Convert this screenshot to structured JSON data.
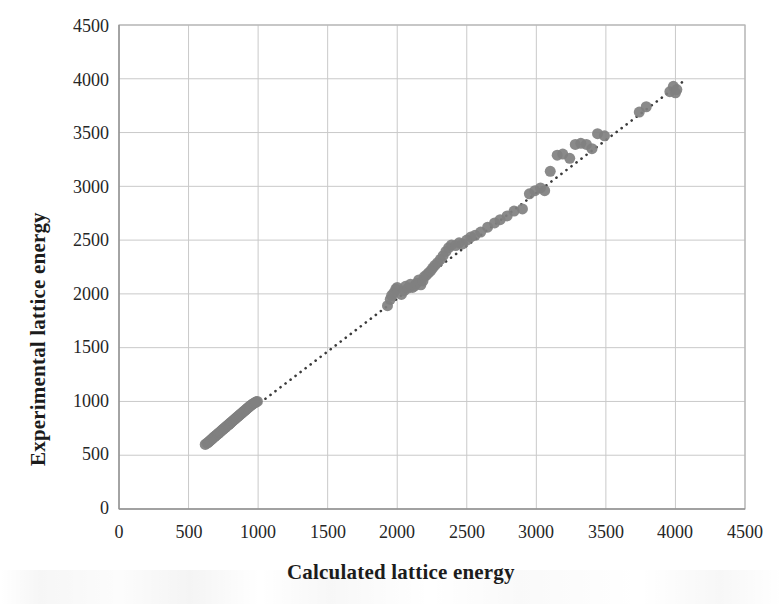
{
  "chart_data": {
    "type": "scatter",
    "title": "",
    "xlabel": "Calculated lattice energy",
    "ylabel": "Experimental lattice energy",
    "xlim": [
      0,
      4500
    ],
    "ylim": [
      0,
      4500
    ],
    "xticks": [
      0,
      500,
      1000,
      1500,
      2000,
      2500,
      3000,
      3500,
      4000,
      4500
    ],
    "yticks": [
      0,
      500,
      1000,
      1500,
      2000,
      2500,
      3000,
      3500,
      4000,
      4500
    ],
    "xtick_labels": [
      "0",
      "500",
      "1000",
      "1500",
      "2000",
      "2500",
      "3000",
      "3500",
      "4000",
      "4500"
    ],
    "ytick_labels": [
      "0",
      "500",
      "1000",
      "1500",
      "2000",
      "2500",
      "3000",
      "3500",
      "4000",
      "4500"
    ],
    "grid": true,
    "legend": false,
    "marker_color": "#808080",
    "marker_size": 11,
    "grid_color": "#c9c9c9",
    "trendline": {
      "style": "dotted",
      "color": "#3b3b3b",
      "x_start": 620,
      "y_start": 600,
      "x_end": 4060,
      "y_end": 3980
    },
    "series": [
      {
        "name": "lattice energy",
        "points": [
          [
            620,
            600
          ],
          [
            632,
            612
          ],
          [
            640,
            618
          ],
          [
            648,
            628
          ],
          [
            655,
            636
          ],
          [
            663,
            645
          ],
          [
            670,
            652
          ],
          [
            676,
            662
          ],
          [
            683,
            668
          ],
          [
            690,
            676
          ],
          [
            697,
            684
          ],
          [
            703,
            690
          ],
          [
            710,
            698
          ],
          [
            716,
            704
          ],
          [
            722,
            712
          ],
          [
            728,
            718
          ],
          [
            735,
            726
          ],
          [
            741,
            733
          ],
          [
            747,
            740
          ],
          [
            753,
            746
          ],
          [
            760,
            754
          ],
          [
            766,
            760
          ],
          [
            772,
            768
          ],
          [
            778,
            774
          ],
          [
            785,
            782
          ],
          [
            791,
            788
          ],
          [
            797,
            795
          ],
          [
            803,
            802
          ],
          [
            810,
            810
          ],
          [
            816,
            816
          ],
          [
            822,
            823
          ],
          [
            828,
            830
          ],
          [
            835,
            838
          ],
          [
            841,
            844
          ],
          [
            847,
            851
          ],
          [
            853,
            858
          ],
          [
            860,
            866
          ],
          [
            866,
            872
          ],
          [
            872,
            879
          ],
          [
            878,
            886
          ],
          [
            885,
            894
          ],
          [
            891,
            900
          ],
          [
            897,
            907
          ],
          [
            903,
            914
          ],
          [
            910,
            922
          ],
          [
            916,
            928
          ],
          [
            922,
            935
          ],
          [
            928,
            942
          ],
          [
            935,
            950
          ],
          [
            941,
            956
          ],
          [
            948,
            963
          ],
          [
            955,
            970
          ],
          [
            962,
            977
          ],
          [
            970,
            984
          ],
          [
            978,
            990
          ],
          [
            986,
            996
          ],
          [
            995,
            1000
          ],
          [
            1930,
            1890
          ],
          [
            1950,
            1950
          ],
          [
            1960,
            1985
          ],
          [
            1975,
            2010
          ],
          [
            1990,
            2045
          ],
          [
            2000,
            2060
          ],
          [
            2030,
            1995
          ],
          [
            2050,
            2030
          ],
          [
            2060,
            2070
          ],
          [
            2080,
            2055
          ],
          [
            2095,
            2090
          ],
          [
            2110,
            2060
          ],
          [
            2125,
            2075
          ],
          [
            2140,
            2100
          ],
          [
            2155,
            2130
          ],
          [
            2170,
            2085
          ],
          [
            2185,
            2120
          ],
          [
            2195,
            2160
          ],
          [
            2210,
            2175
          ],
          [
            2225,
            2195
          ],
          [
            2240,
            2215
          ],
          [
            2255,
            2240
          ],
          [
            2270,
            2265
          ],
          [
            2290,
            2290
          ],
          [
            2310,
            2320
          ],
          [
            2330,
            2355
          ],
          [
            2350,
            2395
          ],
          [
            2370,
            2430
          ],
          [
            2390,
            2455
          ],
          [
            2420,
            2450
          ],
          [
            2445,
            2475
          ],
          [
            2470,
            2465
          ],
          [
            2500,
            2500
          ],
          [
            2530,
            2530
          ],
          [
            2560,
            2545
          ],
          [
            2600,
            2575
          ],
          [
            2650,
            2620
          ],
          [
            2700,
            2660
          ],
          [
            2740,
            2690
          ],
          [
            2790,
            2725
          ],
          [
            2840,
            2770
          ],
          [
            2900,
            2790
          ],
          [
            2950,
            2930
          ],
          [
            2990,
            2960
          ],
          [
            3030,
            2985
          ],
          [
            3060,
            2960
          ],
          [
            3100,
            3140
          ],
          [
            3150,
            3290
          ],
          [
            3190,
            3300
          ],
          [
            3240,
            3260
          ],
          [
            3280,
            3390
          ],
          [
            3320,
            3400
          ],
          [
            3360,
            3390
          ],
          [
            3400,
            3350
          ],
          [
            3440,
            3490
          ],
          [
            3490,
            3470
          ],
          [
            3740,
            3690
          ],
          [
            3790,
            3740
          ],
          [
            3960,
            3880
          ],
          [
            3985,
            3930
          ],
          [
            4000,
            3870
          ],
          [
            4010,
            3900
          ]
        ]
      }
    ]
  }
}
